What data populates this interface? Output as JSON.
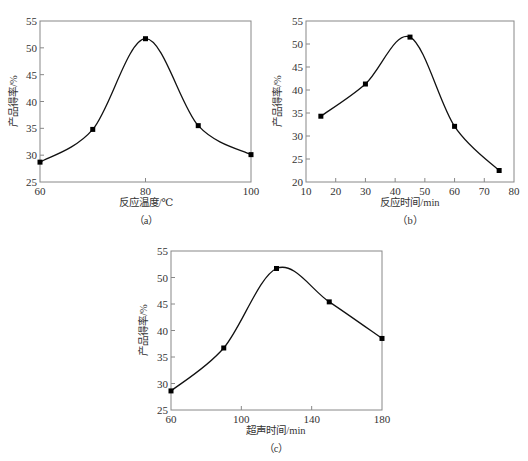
{
  "chart_data": [
    {
      "id": "a",
      "type": "line",
      "caption": "（a）",
      "title": "",
      "xlabel": "反应温度/℃",
      "ylabel": "产品得率/%",
      "x": [
        60,
        70,
        80,
        90,
        100
      ],
      "values": [
        28.7,
        34.8,
        51.7,
        35.5,
        30.1
      ],
      "xlim": [
        60,
        100
      ],
      "ylim": [
        25,
        55
      ],
      "xticks": [
        60,
        80,
        100
      ],
      "yticks": [
        25,
        30,
        35,
        40,
        45,
        50,
        55
      ],
      "grid": false,
      "markers": "square",
      "smooth": true
    },
    {
      "id": "b",
      "type": "line",
      "caption": "（b）",
      "title": "",
      "xlabel": "反应时间/min",
      "ylabel": "产品得率/%",
      "x": [
        15,
        30,
        45,
        60,
        75
      ],
      "values": [
        34.3,
        41.3,
        51.5,
        32.1,
        22.5
      ],
      "xlim": [
        10,
        80
      ],
      "ylim": [
        20,
        55
      ],
      "xticks": [
        10,
        20,
        30,
        40,
        50,
        60,
        70,
        80
      ],
      "yticks": [
        20,
        25,
        30,
        35,
        40,
        45,
        50,
        55
      ],
      "grid": false,
      "markers": "square",
      "smooth": true
    },
    {
      "id": "c",
      "type": "line",
      "caption": "（c）",
      "title": "",
      "xlabel": "超声时间/min",
      "ylabel": "产品得率/%",
      "x": [
        60,
        90,
        120,
        150,
        180
      ],
      "values": [
        28.6,
        36.7,
        51.7,
        45.4,
        38.5
      ],
      "xlim": [
        60,
        180
      ],
      "ylim": [
        25,
        55
      ],
      "xticks": [
        60,
        100,
        140,
        180
      ],
      "yticks": [
        25,
        30,
        35,
        40,
        45,
        50,
        55
      ],
      "grid": false,
      "markers": "square",
      "smooth": true
    }
  ],
  "panels": {
    "a": {
      "caption": "（a）",
      "xlabel": "反应温度/℃",
      "ylabel": "产品得率/%"
    },
    "b": {
      "caption": "（b）",
      "xlabel": "反应时间/min",
      "ylabel": "产品得率/%"
    },
    "c": {
      "caption": "（c）",
      "xlabel": "超声时间/min",
      "ylabel": "产品得率/%"
    }
  }
}
